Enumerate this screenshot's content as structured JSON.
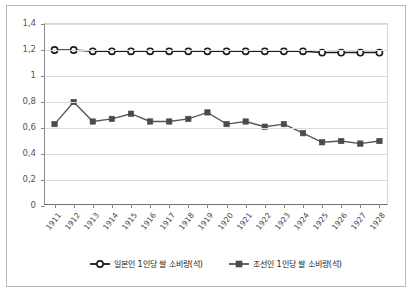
{
  "chart_data": {
    "type": "line",
    "title": "",
    "xlabel": "",
    "ylabel": "",
    "categories": [
      "1911",
      "1912",
      "1913",
      "1914",
      "1915",
      "1916",
      "1917",
      "1918",
      "1919",
      "1920",
      "1921",
      "1922",
      "1923",
      "1924",
      "1925",
      "1926",
      "1927",
      "1928"
    ],
    "ylim": [
      0,
      1.4
    ],
    "ytick_labels": [
      "0",
      "0,2",
      "0,4",
      "0,6",
      "0,8",
      "1",
      "1,2",
      "1,4"
    ],
    "ytick_values": [
      0,
      0.2,
      0.4,
      0.6,
      0.8,
      1.0,
      1.2,
      1.4
    ],
    "grid": true,
    "legend_position": "bottom",
    "decimal_separator": ",",
    "series": [
      {
        "name": "일본인 1인당 쌀 소비량(석)",
        "marker": "open-circle",
        "color": "#1a1a1a",
        "values": [
          1.2,
          1.2,
          1.19,
          1.19,
          1.19,
          1.19,
          1.19,
          1.19,
          1.19,
          1.19,
          1.19,
          1.19,
          1.19,
          1.19,
          1.18,
          1.18,
          1.18,
          1.18
        ]
      },
      {
        "name": "조선인 1인당 쌀 소비량(석)",
        "marker": "filled-square",
        "color": "#4a4a52",
        "values": [
          0.63,
          0.8,
          0.65,
          0.67,
          0.71,
          0.65,
          0.65,
          0.67,
          0.72,
          0.63,
          0.65,
          0.61,
          0.63,
          0.56,
          0.49,
          0.5,
          0.48,
          0.5
        ]
      }
    ]
  },
  "legend": {
    "entries": [
      {
        "label": "일본인 1인당 쌀 소비량(석)",
        "marker": "open-circle-marker"
      },
      {
        "label": "조선인 1인당 쌀 소비량(석)",
        "marker": "filled-square-marker"
      }
    ]
  }
}
